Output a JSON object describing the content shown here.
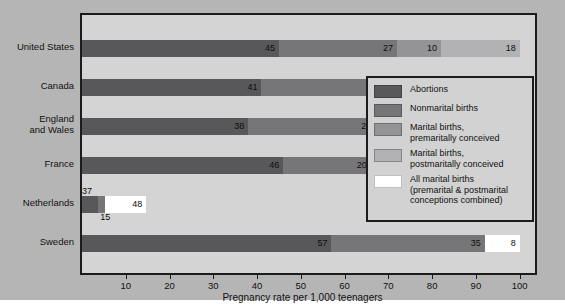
{
  "chart_data": {
    "type": "bar",
    "orientation": "horizontal",
    "stacked": true,
    "title": "",
    "xlabel": "Pregnancy rate per 1,000 teenagers",
    "ylabel": "",
    "xlim": [
      0,
      105
    ],
    "xticks": [
      10,
      20,
      30,
      40,
      50,
      60,
      70,
      80,
      90,
      100
    ],
    "xticklabels": [
      "10",
      "20",
      "30",
      "40",
      "50",
      "60",
      "70",
      "80",
      "90",
      "100"
    ],
    "grid": false,
    "legend_position": "inside-right",
    "categories": [
      "United States",
      "Canada",
      "England and Wales",
      "France",
      "Netherlands",
      "Sweden"
    ],
    "series": [
      {
        "name": "Abortions",
        "color": "#58585a",
        "values": [
          45,
          41,
          38,
          46,
          37,
          57
        ]
      },
      {
        "name": "Nonmarital births",
        "color": "#767679",
        "values": [
          27,
          35,
          29,
          20,
          15,
          35
        ]
      },
      {
        "name": "Marital births, premaritally conceived",
        "color": "#949497",
        "values": [
          10,
          null,
          16,
          null,
          null,
          null
        ]
      },
      {
        "name": "Marital births, postmaritally conceived",
        "color": "#b2b2b4",
        "values": [
          18,
          null,
          17,
          null,
          null,
          null
        ]
      },
      {
        "name": "All marital births (premarital & postmarital conceptions combined)",
        "color": "#ffffff",
        "values": [
          null,
          24,
          null,
          34,
          48,
          8
        ]
      }
    ],
    "rows": [
      {
        "label": "United States",
        "label_lines": [
          "United States"
        ],
        "segments": [
          {
            "series": "Abortions",
            "value": 45,
            "label": "45",
            "color": "#58585a",
            "label_pos": "inside"
          },
          {
            "series": "Nonmarital births",
            "value": 27,
            "label": "27",
            "color": "#767679",
            "label_pos": "inside"
          },
          {
            "series": "Marital births, premaritally conceived",
            "value": 10,
            "label": "10",
            "color": "#949497",
            "label_pos": "inside"
          },
          {
            "series": "Marital births, postmaritally conceived",
            "value": 18,
            "label": "18",
            "color": "#b2b2b4",
            "label_pos": "inside"
          }
        ]
      },
      {
        "label": "Canada",
        "label_lines": [
          "Canada"
        ],
        "segments": [
          {
            "series": "Abortions",
            "value": 41,
            "label": "41",
            "color": "#58585a",
            "label_pos": "inside"
          },
          {
            "series": "Nonmarital births",
            "value": 35,
            "label": "35",
            "color": "#767679",
            "label_pos": "inside"
          },
          {
            "series": "All marital births (premarital & postmarital conceptions combined)",
            "value": 24,
            "label": "24",
            "color": "#ffffff",
            "label_pos": "inside"
          }
        ]
      },
      {
        "label": "England and Wales",
        "label_lines": [
          "England",
          "and Wales"
        ],
        "segments": [
          {
            "series": "Abortions",
            "value": 38,
            "label": "38",
            "color": "#58585a",
            "label_pos": "inside"
          },
          {
            "series": "Nonmarital births",
            "value": 29,
            "label": "29",
            "color": "#767679",
            "label_pos": "inside"
          },
          {
            "series": "Marital births, premaritally conceived",
            "value": 16,
            "label": "16",
            "color": "#949497",
            "label_pos": "inside"
          },
          {
            "series": "Marital births, postmaritally conceived",
            "value": 17,
            "label": "17",
            "color": "#b2b2b4",
            "label_pos": "inside"
          }
        ]
      },
      {
        "label": "France",
        "label_lines": [
          "France"
        ],
        "segments": [
          {
            "series": "Abortions",
            "value": 46,
            "label": "46",
            "color": "#58585a",
            "label_pos": "inside"
          },
          {
            "series": "Nonmarital births",
            "value": 20,
            "label": "20",
            "color": "#767679",
            "label_pos": "inside"
          },
          {
            "series": "All marital births (premarital & postmarital conceptions combined)",
            "value": 34,
            "label": "34",
            "color": "#ffffff",
            "label_pos": "inside"
          }
        ]
      },
      {
        "label": "Netherlands",
        "label_lines": [
          "Netherlands"
        ],
        "segments": [
          {
            "series": "Abortions",
            "value": 3.7,
            "label": "37",
            "color": "#58585a",
            "label_pos": "above"
          },
          {
            "series": "Nonmarital births",
            "value": 1.5,
            "label": "15",
            "color": "#767679",
            "label_pos": "below"
          },
          {
            "series": "All marital births (premarital & postmarital conceptions combined)",
            "value": 9.5,
            "label": "48",
            "color": "#ffffff",
            "label_pos": "inside"
          }
        ]
      },
      {
        "label": "Sweden",
        "label_lines": [
          "Sweden"
        ],
        "segments": [
          {
            "series": "Abortions",
            "value": 57,
            "label": "57",
            "color": "#58585a",
            "label_pos": "inside"
          },
          {
            "series": "Nonmarital births",
            "value": 35,
            "label": "35",
            "color": "#767679",
            "label_pos": "inside"
          },
          {
            "series": "All marital births (premarital & postmarital conceptions combined)",
            "value": 8,
            "label": "8",
            "color": "#ffffff",
            "label_pos": "inside"
          }
        ]
      }
    ],
    "legend": [
      {
        "label": "Abortions",
        "lines": [
          "Abortions"
        ],
        "color": "#58585a"
      },
      {
        "label": "Nonmarital births",
        "lines": [
          "Nonmarital births"
        ],
        "color": "#767679"
      },
      {
        "label": "Marital births, premaritally conceived",
        "lines": [
          "Marital births,",
          "premaritally conceived"
        ],
        "color": "#949497"
      },
      {
        "label": "Marital births, postmaritally conceived",
        "lines": [
          "Marital births,",
          "postmaritally conceived"
        ],
        "color": "#b2b2b4"
      },
      {
        "label": "All marital births (premarital & postmarital conceptions combined)",
        "lines": [
          "All marital births",
          "(premarital & postmarital",
          "conceptions combined)"
        ],
        "color": "#ffffff"
      }
    ]
  },
  "colors": {
    "background": "#b5b5b5",
    "plot_background": "#d4d4d4",
    "frame": "#1c1c1c",
    "legend_background": "#d2d2d2",
    "text": "#111111"
  }
}
